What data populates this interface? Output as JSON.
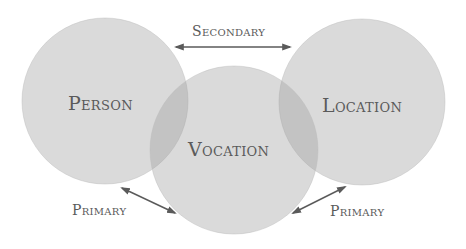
{
  "diagram": {
    "type": "venn",
    "colors": {
      "circle_fill": "#d9d9d9",
      "overlap_fill": "#c6c6c6",
      "text": "#5a5a5a",
      "arrow": "#5a5a5a",
      "background": "#ffffff"
    },
    "circles": [
      {
        "id": "person",
        "label": "Person"
      },
      {
        "id": "vocation",
        "label": "Vocation"
      },
      {
        "id": "location",
        "label": "Location"
      }
    ],
    "relations": [
      {
        "label": "Secondary",
        "from": "person",
        "to": "location"
      },
      {
        "label": "Primary",
        "from": "person",
        "to": "vocation"
      },
      {
        "label": "Primary",
        "from": "vocation",
        "to": "location"
      }
    ]
  }
}
